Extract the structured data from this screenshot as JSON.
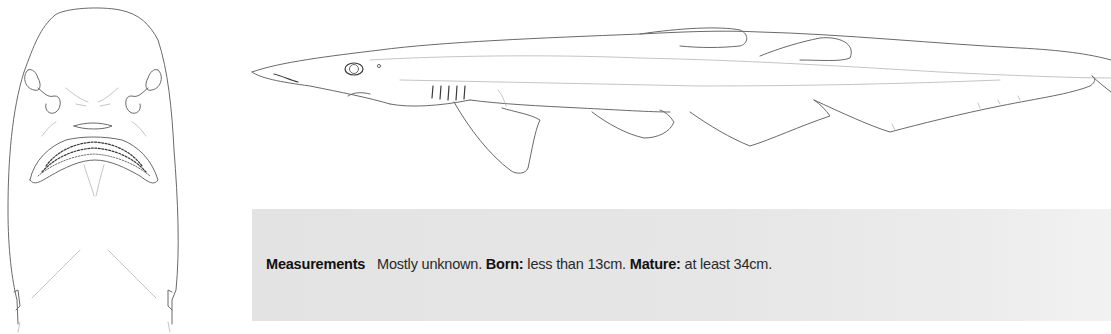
{
  "illustrations": {
    "ventral": {
      "label": "shark-ventral-head-view"
    },
    "lateral": {
      "label": "shark-lateral-view"
    }
  },
  "measurements": {
    "heading": "Measurements",
    "summary": "Mostly unknown.",
    "born_label": "Born:",
    "born_value": "less than 13cm.",
    "mature_label": "Mature:",
    "mature_value": "at least 34cm."
  },
  "colors": {
    "box_background": "#e5e5e5",
    "line_art": "#6a6a6a",
    "text": "#2a2a2a"
  }
}
